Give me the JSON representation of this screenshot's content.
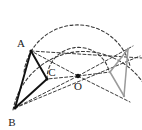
{
  "figure": {
    "type": "geometry-diagram",
    "width": 142,
    "height": 130,
    "background": "#ffffff"
  },
  "labels": {
    "A": "A",
    "B": "B",
    "C": "C",
    "O": "O"
  },
  "colors": {
    "solid_triangle": "#111111",
    "image_triangle": "#9a9a9a",
    "dashed": "#3a3a3a",
    "center_dot": "#000000"
  },
  "points": {
    "A": {
      "x": 31,
      "y": 51,
      "label": "A",
      "label_x": 22,
      "label_y": 46
    },
    "B": {
      "x": 15,
      "y": 108,
      "label": "B",
      "label_x": 11,
      "label_y": 125
    },
    "C": {
      "x": 47,
      "y": 79,
      "label": "C",
      "label_x": 50,
      "label_y": 75
    },
    "O": {
      "x": 78,
      "y": 76,
      "label": "O",
      "label_x": 74,
      "label_y": 90
    },
    "A_image": {
      "x": 128,
      "y": 49
    },
    "B_image": {
      "x": 124,
      "y": 96
    },
    "C_image": {
      "x": 110,
      "y": 72
    }
  },
  "arcs": [
    {
      "name": "arc-through-A",
      "radius": 54,
      "start_deg": 178,
      "end_deg": 15
    },
    {
      "name": "arc-through-B",
      "radius": 72,
      "start_deg": 205,
      "end_deg": 12
    },
    {
      "name": "arc-through-C",
      "radius": 31,
      "start_deg": 183,
      "end_deg": 10
    }
  ],
  "rays": [
    {
      "name": "ray-O-A",
      "from": "O",
      "to": "A"
    },
    {
      "name": "ray-O-B",
      "from": "O",
      "to": "B"
    },
    {
      "name": "ray-O-C",
      "from": "O",
      "to": "C"
    },
    {
      "name": "ray-O-A-image",
      "from": "O",
      "to": "A_image"
    },
    {
      "name": "ray-O-B-image",
      "from": "O",
      "to": "B_image"
    },
    {
      "name": "ray-O-C-image",
      "from": "O",
      "to": "C_image"
    }
  ],
  "segments": {
    "solid": [
      {
        "name": "segment-AB",
        "from": "A",
        "to": "B"
      },
      {
        "name": "segment-BC",
        "from": "B",
        "to": "C"
      },
      {
        "name": "segment-CA",
        "from": "C",
        "to": "A"
      }
    ],
    "image": [
      {
        "name": "segment-A-image-B-image",
        "from": "A_image",
        "to": "B_image"
      },
      {
        "name": "segment-B-image-C-image",
        "from": "B_image",
        "to": "C_image"
      },
      {
        "name": "segment-C-image-A-image",
        "from": "C_image",
        "to": "A_image"
      }
    ]
  }
}
